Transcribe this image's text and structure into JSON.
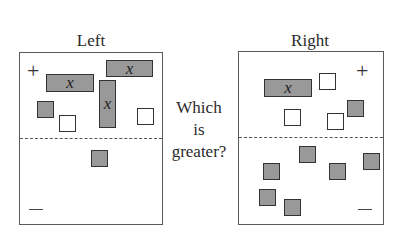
{
  "diagram": {
    "question": [
      "Which",
      "is",
      "greater?"
    ],
    "colors": {
      "variable_fill": "#999999",
      "negative_unit_fill": "#999999",
      "positive_unit_fill": "#ffffff",
      "border": "#333333"
    },
    "left": {
      "title": "Left",
      "plus_sign": "+",
      "minus_sign": "—",
      "variable_label": "x",
      "positive_region": {
        "x_tiles": 3,
        "positive_units": 2,
        "negative_units": 1
      },
      "negative_region": {
        "negative_units": 1
      }
    },
    "right": {
      "title": "Right",
      "plus_sign": "+",
      "minus_sign": "—",
      "variable_label": "x",
      "positive_region": {
        "x_tiles": 1,
        "positive_units": 3,
        "negative_units": 1
      },
      "negative_region": {
        "negative_units": 6
      }
    }
  }
}
